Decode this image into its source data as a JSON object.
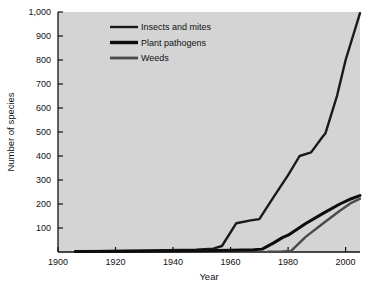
{
  "chart_data": {
    "type": "line",
    "title": "",
    "xlabel": "Year",
    "ylabel": "Number of species",
    "xlim": [
      1900,
      2005
    ],
    "ylim": [
      0,
      1000
    ],
    "grid": false,
    "legend_position": "top-left-inside",
    "background_color": "#d4d4d4",
    "xticks": [
      1900,
      1920,
      1940,
      1960,
      1980,
      2000
    ],
    "xtick_labels": [
      "1900",
      "1920",
      "1940",
      "1960",
      "1980",
      "2000"
    ],
    "yticks": [
      0,
      100,
      200,
      300,
      400,
      500,
      600,
      700,
      800,
      900,
      1000
    ],
    "ytick_labels": [
      "",
      "100",
      "200",
      "300",
      "400",
      "500",
      "600",
      "700",
      "800",
      "900",
      "1,000"
    ],
    "series": [
      {
        "name": "Insects and mites",
        "color": "#1a1a1a",
        "width": 2.4,
        "x": [
          1906,
          1920,
          1938,
          1948,
          1954,
          1957,
          1962,
          1967,
          1970,
          1975,
          1980,
          1984,
          1988,
          1992,
          1993,
          1997,
          2000,
          2005
        ],
        "values": [
          2,
          4,
          7,
          10,
          14,
          25,
          120,
          132,
          137,
          230,
          320,
          400,
          415,
          480,
          495,
          650,
          800,
          995
        ]
      },
      {
        "name": "Plant pathogens",
        "color": "#0d0d0d",
        "width": 3.0,
        "x": [
          1906,
          1930,
          1950,
          1960,
          1968,
          1971,
          1975,
          1978,
          1980,
          1986,
          1992,
          1998,
          2002,
          2005
        ],
        "values": [
          2,
          3,
          5,
          7,
          9,
          12,
          38,
          60,
          70,
          118,
          160,
          200,
          222,
          235
        ]
      },
      {
        "name": "Weeds",
        "color": "#4a4a4a",
        "width": 2.4,
        "x": [
          1973,
          1978,
          1981,
          1986,
          1992,
          1998,
          2002,
          2005
        ],
        "values": [
          1,
          2,
          4,
          62,
          118,
          172,
          205,
          222
        ]
      }
    ]
  },
  "legend": {
    "items": [
      {
        "label": "Insects and mites",
        "color": "#1a1a1a",
        "width": 2.4
      },
      {
        "label": "Plant pathogens",
        "color": "#0d0d0d",
        "width": 3.4
      },
      {
        "label": "Weeds",
        "color": "#4a4a4a",
        "width": 2.8
      }
    ]
  }
}
